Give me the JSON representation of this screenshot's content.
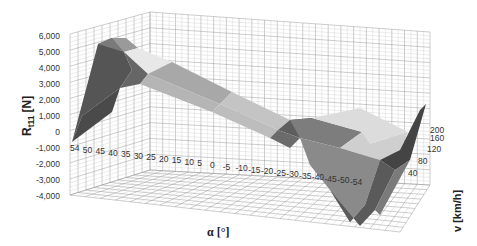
{
  "chart_data": {
    "type": "surface",
    "title": "",
    "ylabel": "R_t11 [N]",
    "ylabel_main": "R",
    "ylabel_sub": "t11",
    "ylabel_unit": "[N]",
    "xlabel": "α [°]",
    "zlabel": "v [km/h]",
    "y_ticks": [
      "6,000",
      "5,000",
      "4,000",
      "3,000",
      "2,000",
      "1,000",
      "0",
      "-1,000",
      "-2,000",
      "-3,000",
      "-4,000"
    ],
    "ylim": [
      -4000,
      6000
    ],
    "x_ticks": [
      "54",
      "50",
      "45",
      "40",
      "35",
      "30",
      "25",
      "20",
      "15",
      "10",
      "5",
      "0",
      "-5",
      "-10",
      "-15",
      "-20",
      "-25",
      "-30",
      "-35",
      "-40",
      "-45",
      "-50",
      "-54"
    ],
    "z_ticks": [
      "200",
      "160",
      "120",
      "80",
      "40"
    ],
    "x": [
      54,
      50,
      45,
      40,
      35,
      30,
      25,
      20,
      15,
      10,
      5,
      0,
      -5,
      -10,
      -15,
      -20,
      -25,
      -30,
      -35,
      -40,
      -45,
      -50,
      -54
    ],
    "series_note": "Surface rises to ~5,500 N at α=54° and falls roughly linearly to ~-3,500 N at α=-54°; nearly constant across speed v.",
    "series": [
      {
        "name": "v=40",
        "values": [
          1200,
          5000,
          4400,
          3900,
          3400,
          2900,
          2400,
          2000,
          1500,
          1000,
          500,
          0,
          -500,
          -1000,
          -1500,
          -2000,
          -2300,
          -2600,
          -2900,
          -3100,
          -3300,
          -3500,
          -3600
        ]
      },
      {
        "name": "v=200",
        "values": [
          1300,
          5500,
          4900,
          4300,
          3700,
          3100,
          2500,
          2000,
          1500,
          1000,
          500,
          0,
          -500,
          -1000,
          -1500,
          -2000,
          -2400,
          -2700,
          -3000,
          -3200,
          -3400,
          -3600,
          -3700
        ]
      }
    ],
    "grid": true,
    "legend": "none"
  }
}
